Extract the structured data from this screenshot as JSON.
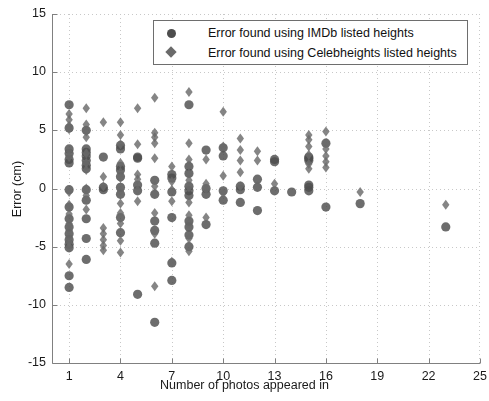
{
  "chart_data": {
    "type": "scatter",
    "title": "",
    "xlabel": "Number of photos appeared in",
    "ylabel": "Error (cm)",
    "xlim": [
      0,
      25
    ],
    "ylim": [
      -15,
      15
    ],
    "xticks": [
      1,
      4,
      7,
      10,
      13,
      16,
      19,
      22,
      25
    ],
    "xtick_labels": [
      "1",
      "4",
      "7",
      "10",
      "13",
      "16",
      "19",
      "22",
      "25"
    ],
    "yticks": [
      -15,
      -10,
      -5,
      0,
      5,
      10,
      15
    ],
    "ytick_labels": [
      "-15",
      "-10",
      "-5",
      "0",
      "5",
      "10",
      "15"
    ],
    "grid": true,
    "grid_style": "dotted",
    "grid_color": "#c8c8c8",
    "axes_color": "#808080",
    "legend": {
      "position": "top-center",
      "border_color": "#6e6e6e",
      "entries": [
        {
          "label": "Error found using IMDb listed heights",
          "marker": "circle",
          "color": "#4d4d4d"
        },
        {
          "label": "Error found using Celebheights listed heights",
          "marker": "diamond",
          "color": "#6a6a6a"
        }
      ]
    },
    "series": [
      {
        "name": "Error found using IMDb listed heights",
        "marker": "circle",
        "color": "#4d4d4d",
        "points": [
          [
            1,
            7.2
          ],
          [
            1,
            5.2
          ],
          [
            1,
            3.4
          ],
          [
            1,
            3.0
          ],
          [
            1,
            2.5
          ],
          [
            1,
            2.2
          ],
          [
            1,
            -0.1
          ],
          [
            1,
            -1.6
          ],
          [
            1,
            -2.6
          ],
          [
            1,
            -3.3
          ],
          [
            1,
            -3.9
          ],
          [
            1,
            -4.4
          ],
          [
            1,
            -4.8
          ],
          [
            1,
            -5.1
          ],
          [
            1,
            -7.5
          ],
          [
            1,
            -8.5
          ],
          [
            2,
            5.0
          ],
          [
            2,
            3.4
          ],
          [
            2,
            3.1
          ],
          [
            2,
            2.8
          ],
          [
            2,
            2.4
          ],
          [
            2,
            2.0
          ],
          [
            2,
            1.7
          ],
          [
            2,
            -0.1
          ],
          [
            2,
            -1.0
          ],
          [
            2,
            -2.6
          ],
          [
            2,
            -4.3
          ],
          [
            2,
            -6.1
          ],
          [
            3,
            2.7
          ],
          [
            3,
            0.1
          ],
          [
            3,
            -0.1
          ],
          [
            4,
            3.7
          ],
          [
            4,
            3.4
          ],
          [
            4,
            1.9
          ],
          [
            4,
            1.6
          ],
          [
            4,
            1.0
          ],
          [
            4,
            0.1
          ],
          [
            4,
            -0.5
          ],
          [
            4,
            -2.5
          ],
          [
            4,
            -3.8
          ],
          [
            5,
            2.7
          ],
          [
            5,
            2.6
          ],
          [
            5,
            0.3
          ],
          [
            5,
            -0.2
          ],
          [
            5,
            -9.1
          ],
          [
            6,
            0.7
          ],
          [
            6,
            -0.5
          ],
          [
            6,
            -2.8
          ],
          [
            6,
            -3.6
          ],
          [
            6,
            -4.7
          ],
          [
            6,
            -11.5
          ],
          [
            7,
            1.2
          ],
          [
            7,
            0.9
          ],
          [
            7,
            -0.3
          ],
          [
            7,
            -2.5
          ],
          [
            7,
            -6.4
          ],
          [
            7,
            -7.9
          ],
          [
            8,
            7.2
          ],
          [
            8,
            1.9
          ],
          [
            8,
            1.3
          ],
          [
            8,
            0.2
          ],
          [
            8,
            -0.2
          ],
          [
            8,
            -0.6
          ],
          [
            8,
            -2.8
          ],
          [
            8,
            -3.3
          ],
          [
            8,
            -4.0
          ],
          [
            8,
            -5.0
          ],
          [
            9,
            3.3
          ],
          [
            9,
            0.0
          ],
          [
            9,
            -0.5
          ],
          [
            9,
            -3.1
          ],
          [
            10,
            3.5
          ],
          [
            10,
            2.8
          ],
          [
            10,
            -0.2
          ],
          [
            10,
            -1.0
          ],
          [
            11,
            0.2
          ],
          [
            11,
            -0.1
          ],
          [
            11,
            -1.2
          ],
          [
            12,
            0.8
          ],
          [
            12,
            0.1
          ],
          [
            12,
            -1.9
          ],
          [
            13,
            2.5
          ],
          [
            13,
            2.3
          ],
          [
            13,
            -0.2
          ],
          [
            14,
            -0.3
          ],
          [
            15,
            2.7
          ],
          [
            15,
            2.6
          ],
          [
            15,
            2.4
          ],
          [
            15,
            0.3
          ],
          [
            15,
            0.1
          ],
          [
            15,
            -0.2
          ],
          [
            16,
            3.9
          ],
          [
            16,
            -1.6
          ],
          [
            18,
            -1.3
          ],
          [
            23,
            -3.3
          ]
        ]
      },
      {
        "name": "Error found using Celebheights listed heights",
        "marker": "diamond",
        "color": "#6a6a6a",
        "points": [
          [
            1,
            6.4
          ],
          [
            1,
            5.9
          ],
          [
            1,
            5.4
          ],
          [
            1,
            5.1
          ],
          [
            1,
            3.2
          ],
          [
            1,
            2.7
          ],
          [
            1,
            -0.3
          ],
          [
            1,
            -1.4
          ],
          [
            1,
            -2.2
          ],
          [
            1,
            -3.0
          ],
          [
            1,
            -3.6
          ],
          [
            1,
            -4.2
          ],
          [
            1,
            -4.6
          ],
          [
            1,
            -5.0
          ],
          [
            1,
            -6.5
          ],
          [
            2,
            6.9
          ],
          [
            2,
            5.5
          ],
          [
            2,
            4.9
          ],
          [
            2,
            4.4
          ],
          [
            2,
            3.0
          ],
          [
            2,
            2.2
          ],
          [
            2,
            1.6
          ],
          [
            2,
            0.0
          ],
          [
            2,
            -0.6
          ],
          [
            2,
            -1.8
          ],
          [
            3,
            5.7
          ],
          [
            3,
            1.0
          ],
          [
            3,
            0.2
          ],
          [
            3,
            -3.4
          ],
          [
            3,
            -3.9
          ],
          [
            3,
            -4.4
          ],
          [
            3,
            -4.9
          ],
          [
            3,
            -5.3
          ],
          [
            4,
            5.7
          ],
          [
            4,
            4.6
          ],
          [
            4,
            3.8
          ],
          [
            4,
            2.2
          ],
          [
            4,
            1.4
          ],
          [
            4,
            0.9
          ],
          [
            4,
            -0.2
          ],
          [
            4,
            -1.3
          ],
          [
            4,
            -2.1
          ],
          [
            4,
            -3.0
          ],
          [
            4,
            -4.5
          ],
          [
            4,
            -5.5
          ],
          [
            5,
            6.9
          ],
          [
            5,
            3.8
          ],
          [
            5,
            1.2
          ],
          [
            5,
            0.8
          ],
          [
            5,
            -0.1
          ],
          [
            5,
            -1.1
          ],
          [
            6,
            7.8
          ],
          [
            6,
            4.8
          ],
          [
            6,
            4.4
          ],
          [
            6,
            3.9
          ],
          [
            6,
            2.6
          ],
          [
            6,
            0.2
          ],
          [
            6,
            -0.4
          ],
          [
            6,
            -2.1
          ],
          [
            6,
            -3.9
          ],
          [
            6,
            -8.4
          ],
          [
            7,
            1.9
          ],
          [
            7,
            0.6
          ],
          [
            7,
            -0.1
          ],
          [
            7,
            -1.1
          ],
          [
            7,
            -6.3
          ],
          [
            8,
            8.3
          ],
          [
            8,
            3.9
          ],
          [
            8,
            2.5
          ],
          [
            8,
            2.0
          ],
          [
            8,
            1.3
          ],
          [
            8,
            0.7
          ],
          [
            8,
            0.1
          ],
          [
            8,
            -1.2
          ],
          [
            8,
            -2.3
          ],
          [
            8,
            -3.0
          ],
          [
            8,
            -4.3
          ],
          [
            8,
            -5.4
          ],
          [
            9,
            2.5
          ],
          [
            9,
            0.4
          ],
          [
            9,
            -0.1
          ],
          [
            9,
            -2.5
          ],
          [
            10,
            6.6
          ],
          [
            10,
            3.6
          ],
          [
            10,
            1.1
          ],
          [
            10,
            -0.4
          ],
          [
            11,
            4.3
          ],
          [
            11,
            3.3
          ],
          [
            11,
            2.4
          ],
          [
            11,
            1.4
          ],
          [
            11,
            0.2
          ],
          [
            12,
            3.2
          ],
          [
            12,
            2.4
          ],
          [
            12,
            0.2
          ],
          [
            13,
            0.4
          ],
          [
            15,
            4.6
          ],
          [
            15,
            4.2
          ],
          [
            15,
            3.6
          ],
          [
            15,
            2.9
          ],
          [
            15,
            2.1
          ],
          [
            15,
            1.7
          ],
          [
            16,
            4.9
          ],
          [
            16,
            3.9
          ],
          [
            16,
            3.4
          ],
          [
            16,
            2.8
          ],
          [
            16,
            2.3
          ],
          [
            16,
            1.8
          ],
          [
            18,
            -0.3
          ],
          [
            23,
            -1.4
          ]
        ]
      }
    ]
  },
  "figure": {
    "background": "#ffffff"
  }
}
